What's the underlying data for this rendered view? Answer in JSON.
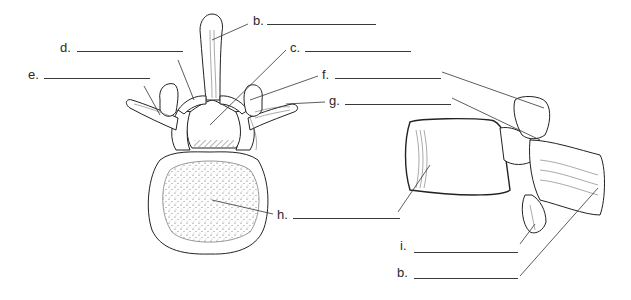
{
  "diagram": {
    "figures": [
      {
        "id": "superior-view",
        "description": "Superior view of lumbar vertebra"
      },
      {
        "id": "lateral-view",
        "description": "Lateral view of lumbar vertebra"
      }
    ],
    "labels": [
      {
        "id": "b-top",
        "letter": "b.",
        "x": 253,
        "y": 14,
        "line_x1": 267,
        "line_x2": 376,
        "line_y": 24
      },
      {
        "id": "c",
        "letter": "c.",
        "x": 290,
        "y": 41,
        "line_x1": 305,
        "line_x2": 411,
        "line_y": 51
      },
      {
        "id": "d",
        "letter": "d.",
        "x": 60,
        "y": 41,
        "line_x1": 77,
        "line_x2": 183,
        "line_y": 51
      },
      {
        "id": "e",
        "letter": "e.",
        "x": 28,
        "y": 68,
        "line_x1": 44,
        "line_x2": 150,
        "line_y": 78
      },
      {
        "id": "f",
        "letter": "f.",
        "x": 322,
        "y": 68,
        "line_x1": 335,
        "line_x2": 441,
        "line_y": 78
      },
      {
        "id": "g",
        "letter": "g.",
        "x": 329,
        "y": 94,
        "line_x1": 345,
        "line_x2": 451,
        "line_y": 104
      },
      {
        "id": "h",
        "letter": "h.",
        "x": 277,
        "y": 208,
        "line_x1": 293,
        "line_x2": 400,
        "line_y": 218
      },
      {
        "id": "i",
        "letter": "i.",
        "x": 400,
        "y": 237,
        "line_x1": 414,
        "line_x2": 518,
        "line_y": 252
      },
      {
        "id": "b-bottom",
        "letter": "b.",
        "x": 397,
        "y": 264,
        "line_x1": 414,
        "line_x2": 518,
        "line_y": 278
      }
    ]
  }
}
